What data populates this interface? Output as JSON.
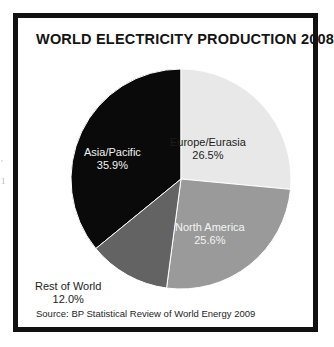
{
  "figure": {
    "title": "WORLD ELECTRICITY PRODUCTION 2008",
    "source": "Source: BP Statistical Review of World Energy 2009",
    "border_color": "#111111",
    "background_color": "#ffffff"
  },
  "scan_artifacts": {
    "mark_one": "'",
    "mark_two": "1"
  },
  "chart_data": {
    "type": "pie",
    "title": "WORLD ELECTRICITY PRODUCTION 2008",
    "xlabel": "",
    "ylabel": "",
    "units": "percent",
    "start_angle_deg": 0,
    "direction": "clockwise",
    "legend": "none (labels drawn on slices)",
    "grid": false,
    "total": 100.0,
    "categories": [
      "Europe/Eurasia",
      "North America",
      "Rest of World",
      "Asia/Pacific"
    ],
    "values": [
      26.5,
      25.6,
      12.0,
      35.9
    ],
    "slices": [
      {
        "name": "Europe/Eurasia",
        "label": "Europe/Eurasia",
        "value": 26.5,
        "value_label": "26.5%",
        "color": "#e8e8e8",
        "text_color": "#1c1c1c",
        "start_deg": 0,
        "end_deg": 95.4
      },
      {
        "name": "North America",
        "label": "North America",
        "value": 25.6,
        "value_label": "25.6%",
        "color": "#9a9a9a",
        "text_color": "#f4f4f4",
        "start_deg": 95.4,
        "end_deg": 187.56
      },
      {
        "name": "Rest of World",
        "label": "Rest of World",
        "value": 12.0,
        "value_label": "12.0%",
        "color": "#636363",
        "text_color": "#1c1c1c",
        "start_deg": 187.56,
        "end_deg": 230.76
      },
      {
        "name": "Asia/Pacific",
        "label": "Asia/Pacific",
        "value": 35.9,
        "value_label": "35.9%",
        "color": "#0a0a0a",
        "text_color": "#f2f2f2",
        "start_deg": 230.76,
        "end_deg": 360
      }
    ]
  }
}
